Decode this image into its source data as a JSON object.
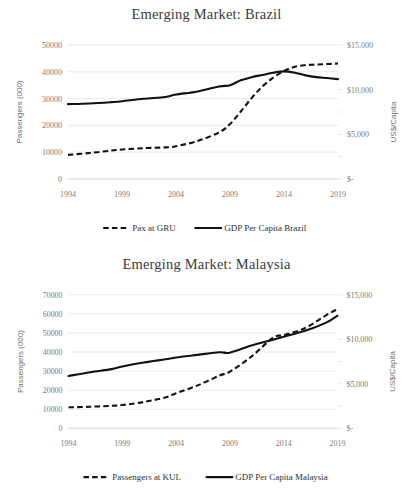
{
  "chart_data": [
    {
      "type": "line",
      "title": "Emerging Market: Brazil",
      "xlabel": "",
      "ylabel": "Passengers (000)",
      "y2label": "US$/Capita",
      "x": [
        1994,
        1999,
        2004,
        2009,
        2014,
        2019
      ],
      "xtick_labels": [
        "1994",
        "1999",
        "2004",
        "2009",
        "2014",
        "2019"
      ],
      "xlim": [
        1994,
        2019
      ],
      "ylim": [
        0,
        50000
      ],
      "ytick_labels": [
        "0",
        "10000",
        "20000",
        "30000",
        "40000",
        "50000"
      ],
      "ytick_values": [
        0,
        10000,
        20000,
        30000,
        40000,
        50000
      ],
      "y2lim": [
        0,
        15000
      ],
      "y2tick_labels": [
        "$-",
        "$5,000",
        "$10,000",
        "$15,000"
      ],
      "y2tick_values": [
        0,
        5000,
        10000,
        15000
      ],
      "grid": true,
      "legend_position": "bottom",
      "series": [
        {
          "name": "Pax at GRU",
          "style": "dashed",
          "axis": "left",
          "x": [
            1994,
            1996,
            1998,
            1999,
            2001,
            2003,
            2004,
            2006,
            2008,
            2009,
            2010,
            2011,
            2012,
            2013,
            2014,
            2015,
            2016,
            2017,
            2018,
            2019
          ],
          "values": [
            9000,
            9700,
            10600,
            11000,
            11500,
            11800,
            12200,
            14200,
            17400,
            20500,
            25200,
            30200,
            34500,
            37800,
            40300,
            41900,
            42500,
            42700,
            42900,
            43100
          ]
        },
        {
          "name": "GDP Per Capita Brazil",
          "style": "solid",
          "axis": "right",
          "x": [
            1994,
            1996,
            1998,
            1999,
            2001,
            2003,
            2004,
            2006,
            2008,
            2009,
            2010,
            2011,
            2012,
            2013,
            2014,
            2015,
            2016,
            2017,
            2018,
            2019
          ],
          "values": [
            8380,
            8450,
            8600,
            8700,
            8980,
            9180,
            9450,
            9800,
            10350,
            10500,
            11050,
            11400,
            11650,
            11900,
            12050,
            11900,
            11600,
            11400,
            11300,
            11180
          ]
        }
      ]
    },
    {
      "type": "line",
      "title": "Emerging Market: Malaysia",
      "xlabel": "",
      "ylabel": "Passengers (000)",
      "y2label": "US$/Capita",
      "x": [
        1994,
        1999,
        2004,
        2009,
        2014,
        2019
      ],
      "xtick_labels": [
        "1994",
        "1999",
        "2004",
        "2009",
        "2014",
        "2019"
      ],
      "xlim": [
        1994,
        2019
      ],
      "ylim": [
        0,
        70000
      ],
      "ytick_labels": [
        "0",
        "10000",
        "20000",
        "30000",
        "40000",
        "50000",
        "60000",
        "70000"
      ],
      "ytick_values": [
        0,
        10000,
        20000,
        30000,
        40000,
        50000,
        60000,
        70000
      ],
      "y2lim": [
        0,
        15000
      ],
      "y2tick_labels": [
        "$-",
        "$5,000",
        "$10,000",
        "$15,000"
      ],
      "y2tick_values": [
        0,
        5000,
        10000,
        15000
      ],
      "grid": true,
      "legend_position": "bottom",
      "series": [
        {
          "name": "Passengers at KUL",
          "style": "dashed",
          "axis": "left",
          "x": [
            1994,
            1996,
            1998,
            1999,
            2001,
            2003,
            2004,
            2006,
            2008,
            2009,
            2011,
            2013,
            2014,
            2016,
            2018,
            2019
          ],
          "values": [
            11000,
            11300,
            11800,
            12200,
            13800,
            16200,
            18400,
            22500,
            27600,
            29700,
            37600,
            47500,
            48900,
            52600,
            59500,
            62500
          ]
        },
        {
          "name": "GDP Per Capita Malaysia",
          "style": "solid",
          "axis": "right",
          "x": [
            1994,
            1996,
            1998,
            1999,
            2001,
            2003,
            2004,
            2006,
            2008,
            2009,
            2011,
            2013,
            2014,
            2016,
            2018,
            2019
          ],
          "values": [
            5880,
            6300,
            6650,
            6950,
            7400,
            7750,
            7950,
            8250,
            8550,
            8500,
            9300,
            9950,
            10300,
            10950,
            11900,
            12650
          ]
        }
      ]
    }
  ]
}
